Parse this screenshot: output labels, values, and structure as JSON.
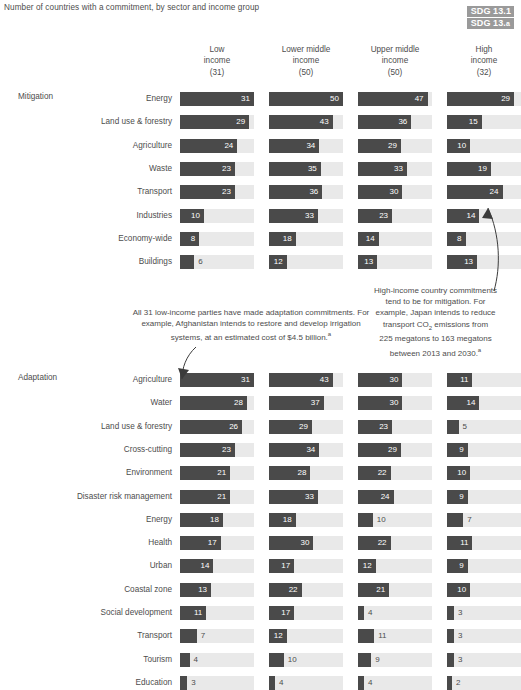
{
  "header": {
    "subtitle": "Number of countries with a commitment, by sector and income group",
    "sdg_badge": {
      "line1": "SDG 13.1",
      "line2_main": "SDG 13.",
      "line2_sup": "a"
    }
  },
  "sections": {
    "mitigation_label": "Mitigation",
    "adaptation_label": "Adaptation"
  },
  "annotations": {
    "left": "All 31 low-income parties have made adaptation commitments. For example, Afghanistan intends to restore and develop irrigation systems, at an estimated cost of $4.5 billion.",
    "left_sup": "a",
    "right_l1": "High-income country commitments",
    "right_l2": "tend to be for mitigation. For",
    "right_l3": "example, Japan intends to reduce",
    "right_l4a": "transport CO",
    "right_l4sub": "2",
    "right_l4b": " emissions from",
    "right_l5": "225 megatons to 163 megatons",
    "right_l6": "between 2013 and 2030.",
    "right_sup": "a"
  },
  "chart_data": {
    "type": "bar",
    "title": "Number of countries with a commitment, by sector and income group",
    "xlabel": "",
    "ylabel": "",
    "grid": false,
    "legend": "none",
    "orientation": "horizontal",
    "columns": [
      {
        "name": "Low income",
        "line1": "Low",
        "line2": "income",
        "count_label": "(31)",
        "total": 31
      },
      {
        "name": "Lower middle income",
        "line1": "Lower middle",
        "line2": "income",
        "count_label": "(50)",
        "total": 50
      },
      {
        "name": "Upper middle income",
        "line1": "Upper middle",
        "line2": "income",
        "count_label": "(50)",
        "total": 50
      },
      {
        "name": "High income",
        "line1": "High",
        "line2": "income",
        "count_label": "(32)",
        "total": 32
      }
    ],
    "groups": [
      {
        "name": "Mitigation",
        "rows": [
          {
            "sector": "Energy",
            "values": [
              31,
              50,
              47,
              29
            ]
          },
          {
            "sector": "Land use & forestry",
            "values": [
              29,
              43,
              36,
              15
            ]
          },
          {
            "sector": "Agriculture",
            "values": [
              24,
              34,
              29,
              10
            ]
          },
          {
            "sector": "Waste",
            "values": [
              23,
              35,
              33,
              19
            ]
          },
          {
            "sector": "Transport",
            "values": [
              23,
              36,
              30,
              24
            ]
          },
          {
            "sector": "Industries",
            "values": [
              10,
              33,
              23,
              14
            ]
          },
          {
            "sector": "Economy-wide",
            "values": [
              8,
              18,
              14,
              8
            ]
          },
          {
            "sector": "Buildings",
            "values": [
              6,
              12,
              13,
              13
            ]
          }
        ]
      },
      {
        "name": "Adaptation",
        "rows": [
          {
            "sector": "Agriculture",
            "values": [
              31,
              43,
              30,
              11
            ]
          },
          {
            "sector": "Water",
            "values": [
              28,
              37,
              30,
              14
            ]
          },
          {
            "sector": "Land use & forestry",
            "values": [
              26,
              29,
              23,
              5
            ]
          },
          {
            "sector": "Cross-cutting",
            "values": [
              23,
              34,
              29,
              9
            ]
          },
          {
            "sector": "Environment",
            "values": [
              21,
              28,
              22,
              10
            ]
          },
          {
            "sector": "Disaster risk management",
            "values": [
              21,
              33,
              24,
              9
            ]
          },
          {
            "sector": "Energy",
            "values": [
              18,
              18,
              10,
              7
            ]
          },
          {
            "sector": "Health",
            "values": [
              17,
              30,
              22,
              11
            ]
          },
          {
            "sector": "Urban",
            "values": [
              14,
              17,
              12,
              9
            ]
          },
          {
            "sector": "Coastal zone",
            "values": [
              13,
              22,
              21,
              10
            ]
          },
          {
            "sector": "Social development",
            "values": [
              11,
              17,
              4,
              3
            ]
          },
          {
            "sector": "Transport",
            "values": [
              7,
              12,
              11,
              3
            ]
          },
          {
            "sector": "Tourism",
            "values": [
              4,
              10,
              9,
              3
            ]
          },
          {
            "sector": "Education",
            "values": [
              3,
              4,
              4,
              2
            ]
          }
        ]
      }
    ],
    "colors": {
      "bar": "#4a4a4a",
      "track": "#e9e9e9",
      "text": "#4d4d4d",
      "badge": "#9a9a9a"
    }
  }
}
